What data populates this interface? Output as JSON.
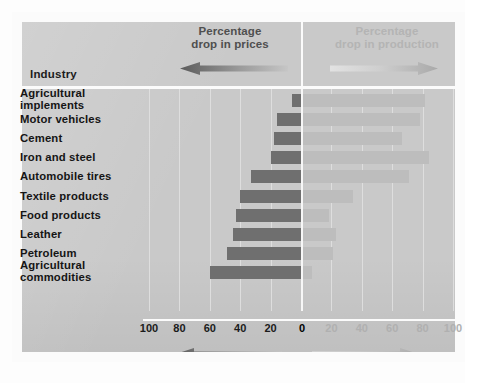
{
  "figure": {
    "header": {
      "prices_title": "Percentage\ndrop in prices",
      "prices_title_line1": "Percentage",
      "prices_title_line2": "drop in prices",
      "production_title_line1": "Percentage",
      "production_title_line2": "drop in production",
      "industry_label": "Industry",
      "left_arrow_icon": "arrow-left-icon",
      "right_arrow_icon": "arrow-right-icon"
    },
    "footer": {
      "left_arrow_icon": "arrow-left-icon",
      "right_arrow_icon": "arrow-right-icon"
    },
    "colors": {
      "panel": "#c9c9c9",
      "frame": "#fbfbfb",
      "bar_prices": "#6f6f6f",
      "bar_production": "#bdbdbd",
      "text_dark": "#151515",
      "text_muted": "#b0b0b0"
    }
  },
  "chart_data": {
    "type": "bar",
    "orientation": "horizontal-diverging",
    "xlabel": "",
    "ylabel": "Industry",
    "grid": true,
    "legend_position": "top",
    "axis": {
      "left_ticks": [
        100,
        80,
        60,
        40,
        20
      ],
      "center_tick": 0,
      "right_ticks": [
        20,
        40,
        60,
        80,
        100
      ],
      "left_label_text": [
        "100",
        "80",
        "60",
        "40",
        "20"
      ],
      "center_label_text": "0",
      "right_label_text": [
        "20",
        "40",
        "60",
        "80",
        "100"
      ],
      "xlim": [
        -100,
        100
      ]
    },
    "categories": [
      "Agricultural implements",
      "Motor vehicles",
      "Cement",
      "Iron and steel",
      "Automobile tires",
      "Textile products",
      "Food products",
      "Leather",
      "Petroleum",
      "Agricultural commodities"
    ],
    "category_lines": [
      [
        "Agricultural",
        "implements"
      ],
      [
        "Motor vehicles"
      ],
      [
        "Cement"
      ],
      [
        "Iron and steel"
      ],
      [
        "Automobile tires"
      ],
      [
        "Textile products"
      ],
      [
        "Food products"
      ],
      [
        "Leather"
      ],
      [
        "Petroleum"
      ],
      [
        "Agricultural",
        "commodities"
      ]
    ],
    "series": [
      {
        "name": "Percentage drop in prices",
        "side": "left",
        "color": "#6f6f6f",
        "values": [
          6,
          16,
          18,
          20,
          33,
          40,
          43,
          45,
          49,
          60
        ]
      },
      {
        "name": "Percentage drop in production",
        "side": "right",
        "color": "#bdbdbd",
        "values": [
          80,
          77,
          65,
          83,
          70,
          33,
          17,
          22,
          20,
          6
        ]
      }
    ]
  }
}
